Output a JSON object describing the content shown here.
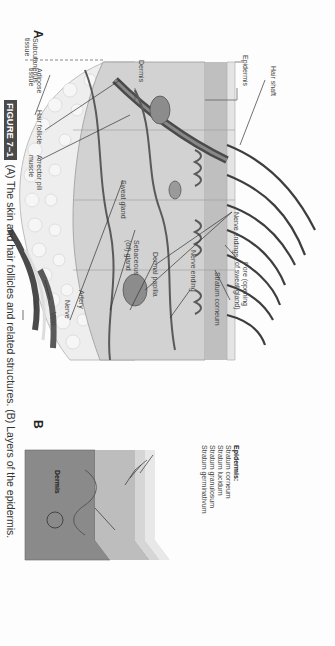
{
  "figure": {
    "tag": "FIGURE 7–1",
    "caption": "(A) The skin and hair follicles and related structures. (B) Layers of the epidermis.",
    "panel_a_letter": "A",
    "panel_b_letter": "B"
  },
  "panel_a": {
    "layer_labels": {
      "epidermis": "Epidermis",
      "dermis": "Dermis",
      "subcutaneous_1": "Subcutaneous",
      "subcutaneous_2": "tissue"
    },
    "labels": {
      "hair_shaft": "Hair shaft",
      "nerve_endings": "Nerve endings",
      "pore_1": "Pore (opening",
      "pore_2": "of sweat gland)",
      "stratum_corneum": "Stratum corneum",
      "nerve_ending": "Nerve ending",
      "dermal_papilla": "Dermal papilla",
      "sebaceous_1": "Sebaceous",
      "sebaceous_2": "(oil) gland",
      "sweat_gland": "Sweat gland",
      "artery": "Artery",
      "nerve": "Nerve",
      "vein": "Vein",
      "adipose_1": "Adipose",
      "adipose_2": "tissue",
      "hair_follicle": "Hair follicle",
      "arrector_1": "Arrector pili",
      "arrector_2": "muscle"
    }
  },
  "panel_b": {
    "heading": "Epidermis:",
    "layers": [
      "Stratum corneum",
      "Stratum lucidum",
      "Stratum granulosum",
      "Stratum germinativum"
    ],
    "dermis_label": "Dermis"
  },
  "colors": {
    "figure_tag_bg": "#4a4a4a",
    "skin_light": "#d9d9d9",
    "skin_mid": "#a8a8a8",
    "vessel_dark": "#5a5a5a",
    "fat": "#eeeeee"
  }
}
